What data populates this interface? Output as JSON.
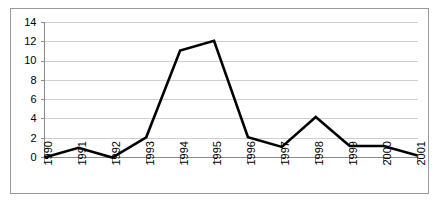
{
  "chart_data": {
    "type": "line",
    "title": "",
    "subtitle": "",
    "xlabel": "",
    "ylabel": "",
    "categories": [
      "1990",
      "1991",
      "1992",
      "1993",
      "1994",
      "1995",
      "1996",
      "1997",
      "1998",
      "1999",
      "2000",
      "2001"
    ],
    "values": [
      0,
      1,
      0,
      2.1,
      11.1,
      12.1,
      2.1,
      1.1,
      4.2,
      1.2,
      1.2,
      0.2
    ],
    "series": [
      {
        "name": "",
        "values": [
          0,
          1,
          0,
          2.1,
          11.1,
          12.1,
          2.1,
          1.1,
          4.2,
          1.2,
          1.2,
          0.2
        ]
      }
    ],
    "ylim": [
      0,
      14
    ],
    "yticks": [
      0,
      2,
      4,
      6,
      8,
      10,
      12,
      14
    ],
    "ytick_labels": [
      "0",
      "2",
      "4",
      "6",
      "8",
      "10",
      "12",
      "14"
    ],
    "grid": "horizontal",
    "legend": "none",
    "xtick_rotation": -90,
    "annotations": [],
    "colors": {
      "line": "#000000",
      "gridline": "#cfcfcf",
      "axis": "#8d8d8d",
      "border": "#9a9a9a",
      "background": "#ffffff",
      "text": "#000000"
    }
  }
}
